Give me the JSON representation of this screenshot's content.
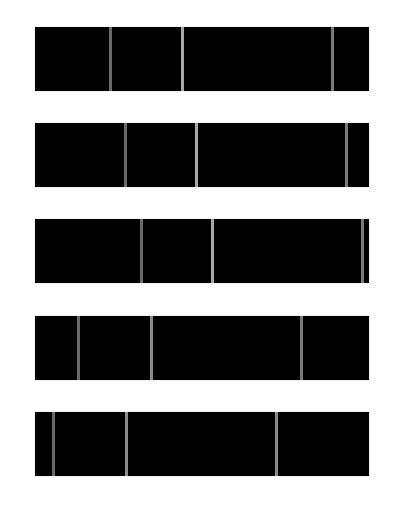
{
  "diagram": {
    "type": "segmented-bars",
    "bar_left": 35,
    "bar_width": 334,
    "bar_height": 64,
    "bar_color": "#000000",
    "bars": [
      {
        "top": 27,
        "dividers": [
          {
            "x": 110,
            "color": "#6a6a6a"
          },
          {
            "x": 182,
            "color": "#a8a8a8"
          },
          {
            "x": 332,
            "color": "#7a7a7a"
          }
        ]
      },
      {
        "top": 123,
        "dividers": [
          {
            "x": 125,
            "color": "#6a6a6a"
          },
          {
            "x": 196,
            "color": "#a8a8a8"
          },
          {
            "x": 346,
            "color": "#7a7a7a"
          }
        ]
      },
      {
        "top": 219,
        "dividers": [
          {
            "x": 141,
            "color": "#6a6a6a"
          },
          {
            "x": 212,
            "color": "#a8a8a8"
          },
          {
            "x": 362,
            "color": "#7a7a7a"
          }
        ]
      },
      {
        "top": 316,
        "dividers": [
          {
            "x": 78,
            "color": "#6a6a6a"
          },
          {
            "x": 151,
            "color": "#8a8a8a"
          },
          {
            "x": 301,
            "color": "#7a7a7a"
          }
        ]
      },
      {
        "top": 412,
        "dividers": [
          {
            "x": 53,
            "color": "#6a6a6a"
          },
          {
            "x": 126,
            "color": "#8a8a8a"
          },
          {
            "x": 276,
            "color": "#8a8a8a"
          }
        ]
      }
    ]
  }
}
